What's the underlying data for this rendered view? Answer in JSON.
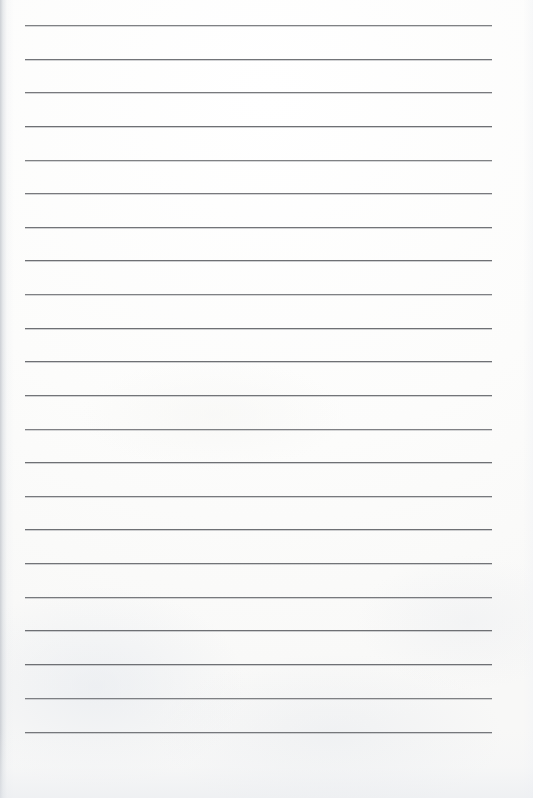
{
  "document": {
    "kind": "scanned-lined-notepad-page",
    "title": "Blank ruled paper",
    "text_content": "",
    "page_width": 533,
    "page_height": 798,
    "paper_color": "#fdfdfc",
    "rule_color": "#6e7074",
    "rule_count": 22,
    "rule_left": 25,
    "rule_right": 492,
    "rule_first_y": 25,
    "rule_spacing": 33.67,
    "margins": {
      "left": 25,
      "right": 41,
      "top": 25,
      "bottom": 66
    },
    "rules": [
      {
        "y": 25
      },
      {
        "y": 59
      },
      {
        "y": 92
      },
      {
        "y": 126
      },
      {
        "y": 160
      },
      {
        "y": 193
      },
      {
        "y": 227
      },
      {
        "y": 260
      },
      {
        "y": 294
      },
      {
        "y": 328
      },
      {
        "y": 361
      },
      {
        "y": 395
      },
      {
        "y": 429
      },
      {
        "y": 462
      },
      {
        "y": 496
      },
      {
        "y": 529
      },
      {
        "y": 563
      },
      {
        "y": 597
      },
      {
        "y": 630
      },
      {
        "y": 664
      },
      {
        "y": 698
      },
      {
        "y": 732
      }
    ]
  }
}
